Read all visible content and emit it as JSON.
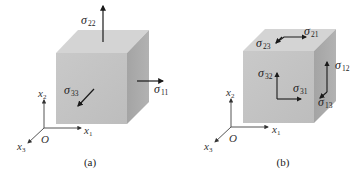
{
  "figure": {
    "colors": {
      "front_face": "#c4c4c4",
      "top_face": "#d3d3d3",
      "right_face": "#a9a9a9",
      "arrow": "#1a1a1a",
      "axis": "#555555"
    },
    "panels": [
      {
        "caption": "(a)",
        "description": "Normal stress components on a cube",
        "axes": {
          "origin": "O",
          "x1": "x",
          "x1_sub": "1",
          "x2": "x",
          "x2_sub": "2",
          "x3": "x",
          "x3_sub": "3"
        },
        "stresses": [
          {
            "symbol": "σ",
            "sub": "22",
            "face": "top",
            "direction": "+x2"
          },
          {
            "symbol": "σ",
            "sub": "11",
            "face": "right",
            "direction": "+x1"
          },
          {
            "symbol": "σ",
            "sub": "33",
            "face": "front",
            "direction": "+x3"
          }
        ]
      },
      {
        "caption": "(b)",
        "description": "Shear stress components on a cube",
        "axes": {
          "origin": "O",
          "x1": "x",
          "x1_sub": "1",
          "x2": "x",
          "x2_sub": "2",
          "x3": "x",
          "x3_sub": "3"
        },
        "stresses": [
          {
            "symbol": "σ",
            "sub": "23",
            "face": "top",
            "direction": "+x3"
          },
          {
            "symbol": "σ",
            "sub": "21",
            "face": "top",
            "direction": "+x1"
          },
          {
            "symbol": "σ",
            "sub": "32",
            "face": "front",
            "direction": "+x2"
          },
          {
            "symbol": "σ",
            "sub": "31",
            "face": "front",
            "direction": "+x1"
          },
          {
            "symbol": "σ",
            "sub": "12",
            "face": "right",
            "direction": "+x2"
          },
          {
            "symbol": "σ",
            "sub": "13",
            "face": "right",
            "direction": "+x3"
          }
        ]
      }
    ]
  }
}
